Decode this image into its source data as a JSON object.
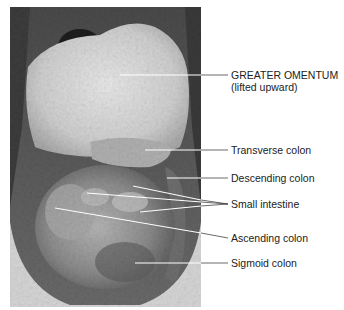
{
  "figure": {
    "labels": [
      {
        "id": "greater-omentum",
        "text": "GREATER OMENTUM",
        "subtext": "(lifted upward)"
      },
      {
        "id": "transverse-colon",
        "text": "Transverse colon"
      },
      {
        "id": "descending-colon",
        "text": "Descending colon"
      },
      {
        "id": "small-intestine",
        "text": "Small intestine"
      },
      {
        "id": "ascending-colon",
        "text": "Ascending colon"
      },
      {
        "id": "sigmoid-colon",
        "text": "Sigmoid colon"
      }
    ]
  },
  "colors": {
    "leader_line": "#ffffff",
    "leader_line_outside": "#444444",
    "label_text": "#222222"
  }
}
